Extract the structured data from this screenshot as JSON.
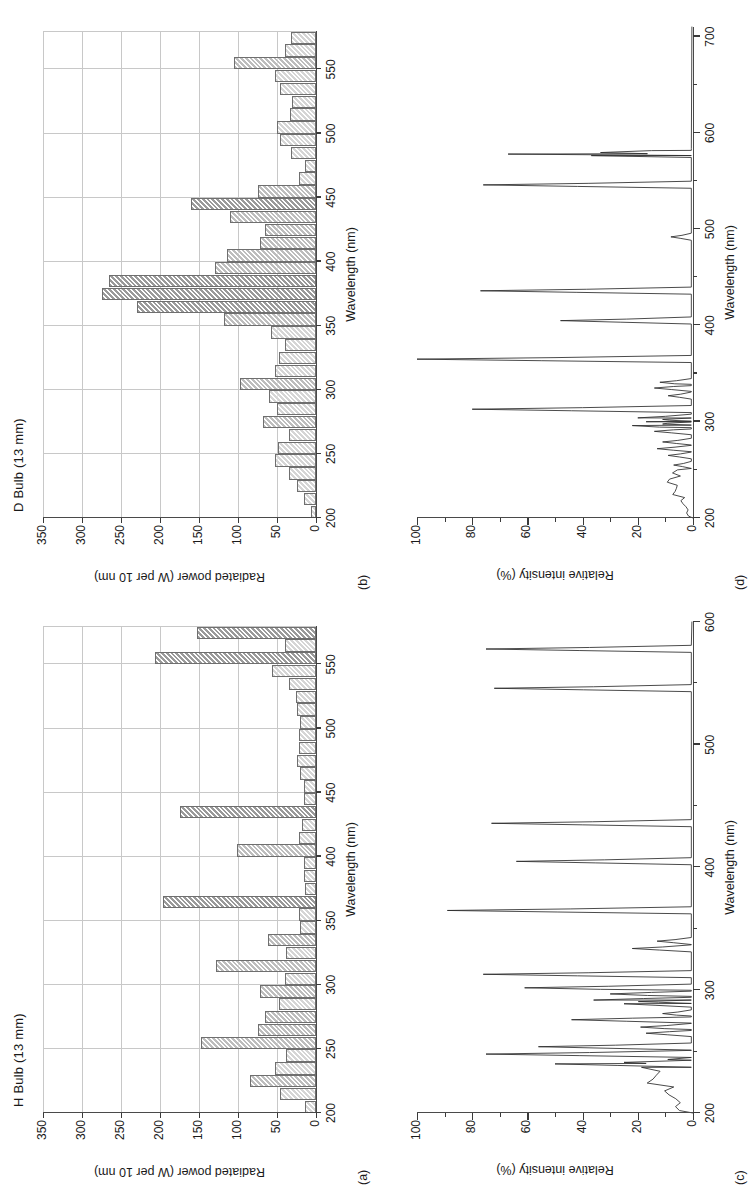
{
  "figure": {
    "caption_axis_x": "Wavelength (nm)",
    "caption_axis_y_power": "Radiated power (W per 10 nm)",
    "caption_axis_y_intensity": "Relative intensity (%)",
    "rotation_degrees": "-90",
    "panel_labels": [
      "(a)",
      "(b)",
      "(c)",
      "(d)"
    ],
    "colors": {
      "line": "#2b2b2b",
      "grid": "#c8c8c8",
      "axis": "#4a4a4a",
      "bar_light": "#d5d5d5",
      "bar_mid": "#bdbdbd",
      "bar_dark": "#9a9a9a",
      "bar_edge": "#6f6f6f"
    }
  },
  "chart_data": [
    {
      "id": "panel-a",
      "panel_label": "(a)",
      "type": "bar",
      "title": "H Bulb (13 mm)",
      "xlabel": "Wavelength (nm)",
      "ylabel": "Radiated power (W per 10 nm)",
      "xlim": [
        200,
        580
      ],
      "ylim": [
        0,
        350
      ],
      "xticks": [
        200,
        250,
        300,
        350,
        400,
        450,
        500,
        550
      ],
      "yticks": [
        0,
        50,
        100,
        150,
        200,
        250,
        300,
        350
      ],
      "bin_width": 10,
      "grid": true,
      "categories": [
        200,
        210,
        220,
        230,
        240,
        250,
        260,
        270,
        280,
        290,
        300,
        310,
        320,
        330,
        340,
        350,
        360,
        370,
        380,
        390,
        400,
        410,
        420,
        430,
        440,
        450,
        460,
        470,
        480,
        490,
        500,
        510,
        520,
        530,
        540,
        550,
        560,
        570
      ],
      "values": [
        14,
        46,
        85,
        52,
        39,
        147,
        75,
        65,
        47,
        72,
        40,
        128,
        38,
        62,
        20,
        22,
        196,
        14,
        16,
        15,
        101,
        22,
        18,
        175,
        16,
        16,
        20,
        24,
        22,
        22,
        20,
        24,
        26,
        35,
        56,
        207,
        40,
        152
      ]
    },
    {
      "id": "panel-b",
      "panel_label": "(b)",
      "type": "bar",
      "title": "D Bulb (13 mm)",
      "xlabel": "Wavelength (nm)",
      "ylabel": "Radiated power (W per 10 nm)",
      "xlim": [
        200,
        580
      ],
      "ylim": [
        0,
        350
      ],
      "xticks": [
        200,
        250,
        300,
        350,
        400,
        450,
        500,
        550
      ],
      "yticks": [
        0,
        50,
        100,
        150,
        200,
        250,
        300,
        350
      ],
      "bin_width": 10,
      "grid": true,
      "categories": [
        200,
        210,
        220,
        230,
        240,
        250,
        260,
        270,
        280,
        290,
        300,
        310,
        320,
        330,
        340,
        350,
        360,
        370,
        380,
        390,
        400,
        410,
        420,
        430,
        440,
        450,
        460,
        470,
        480,
        490,
        500,
        510,
        520,
        530,
        540,
        550,
        560,
        570
      ],
      "values": [
        6,
        16,
        24,
        34,
        52,
        49,
        34,
        68,
        50,
        60,
        97,
        53,
        47,
        40,
        58,
        118,
        230,
        275,
        265,
        130,
        114,
        72,
        66,
        110,
        160,
        74,
        22,
        14,
        32,
        46,
        50,
        33,
        31,
        46,
        52,
        105,
        40,
        32
      ]
    },
    {
      "id": "panel-c",
      "panel_label": "(c)",
      "type": "line",
      "title": "",
      "xlabel": "Wavelength (nm)",
      "ylabel": "Relative intensity (%)",
      "xlim": [
        200,
        600
      ],
      "ylim": [
        0,
        100
      ],
      "xticks": [
        200,
        300,
        400,
        500,
        600
      ],
      "xminorticks": [
        250,
        350,
        450,
        550
      ],
      "yticks": [
        0,
        20,
        40,
        60,
        80,
        100
      ],
      "grid": false,
      "peaks": [
        {
          "x": 240,
          "y": 50
        },
        {
          "x": 248,
          "y": 75
        },
        {
          "x": 254,
          "y": 56
        },
        {
          "x": 265,
          "y": 17
        },
        {
          "x": 270,
          "y": 19
        },
        {
          "x": 276,
          "y": 44
        },
        {
          "x": 281,
          "y": 11
        },
        {
          "x": 289,
          "y": 25
        },
        {
          "x": 292,
          "y": 36
        },
        {
          "x": 297,
          "y": 30
        },
        {
          "x": 302,
          "y": 61
        },
        {
          "x": 313,
          "y": 76
        },
        {
          "x": 334,
          "y": 22
        },
        {
          "x": 340,
          "y": 13
        },
        {
          "x": 365,
          "y": 89
        },
        {
          "x": 405,
          "y": 64
        },
        {
          "x": 436,
          "y": 73
        },
        {
          "x": 546,
          "y": 72
        },
        {
          "x": 578,
          "y": 75
        }
      ],
      "continuum_note": "low broad continuum ~10-20% between 200 and 245 nm"
    },
    {
      "id": "panel-d",
      "panel_label": "(d)",
      "type": "line",
      "title": "",
      "xlabel": "Wavelength (nm)",
      "ylabel": "Relative intensity (%)",
      "xlim": [
        200,
        710
      ],
      "ylim": [
        0,
        100
      ],
      "xticks": [
        200,
        300,
        400,
        500,
        600,
        700
      ],
      "xminorticks": [
        250,
        350,
        450,
        550,
        650
      ],
      "yticks": [
        0,
        20,
        40,
        60,
        80,
        100
      ],
      "grid": false,
      "peaks": [
        {
          "x": 255,
          "y": 7
        },
        {
          "x": 265,
          "y": 9
        },
        {
          "x": 272,
          "y": 13
        },
        {
          "x": 279,
          "y": 11
        },
        {
          "x": 290,
          "y": 14
        },
        {
          "x": 296,
          "y": 22
        },
        {
          "x": 300,
          "y": 17
        },
        {
          "x": 304,
          "y": 20
        },
        {
          "x": 313,
          "y": 80
        },
        {
          "x": 327,
          "y": 9
        },
        {
          "x": 335,
          "y": 14
        },
        {
          "x": 341,
          "y": 12
        },
        {
          "x": 365,
          "y": 100
        },
        {
          "x": 405,
          "y": 48
        },
        {
          "x": 436,
          "y": 77
        },
        {
          "x": 492,
          "y": 8
        },
        {
          "x": 546,
          "y": 76
        },
        {
          "x": 578,
          "y": 67
        },
        {
          "x": 580,
          "y": 30
        }
      ],
      "continuum_note": "broad low bands between 240 and 310 nm, near-zero above 600 nm"
    }
  ]
}
